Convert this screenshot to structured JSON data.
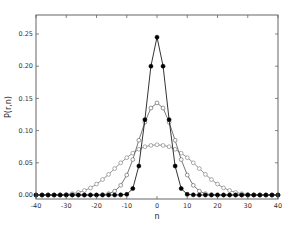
{
  "chart_data": {
    "type": "line",
    "title": "",
    "xlabel": "n",
    "ylabel": "P(r,n)",
    "xlim": [
      -40,
      40
    ],
    "ylim": [
      -0.01,
      0.28
    ],
    "xticks": [
      -40,
      -30,
      -20,
      -10,
      0,
      10,
      20,
      30,
      40
    ],
    "yticks": [
      0.0,
      0.05,
      0.1,
      0.15,
      0.2,
      0.25
    ],
    "xtick_labels": [
      "-40",
      "-30",
      "-20",
      "-10",
      "0",
      "10",
      "20",
      "30",
      "40"
    ],
    "ytick_labels": [
      "0.00",
      "0.05",
      "0.10",
      "0.15",
      "0.20",
      "0.25"
    ],
    "grid": false,
    "legend": null,
    "series": [
      {
        "name": "narrow",
        "marker": "filled-circle",
        "color": "#000000",
        "x": [
          -40,
          -38,
          -36,
          -34,
          -32,
          -30,
          -28,
          -26,
          -24,
          -22,
          -20,
          -18,
          -16,
          -14,
          -12,
          -10,
          -8,
          -6,
          -4,
          -2,
          0,
          2,
          4,
          6,
          8,
          10,
          12,
          14,
          16,
          18,
          20,
          22,
          24,
          26,
          28,
          30,
          32,
          34,
          36,
          38,
          40
        ],
        "y": [
          0,
          0,
          0,
          0,
          0,
          0,
          0,
          0,
          0,
          0,
          0,
          0,
          0,
          0,
          0.0002,
          0.001,
          0.01,
          0.045,
          0.117,
          0.2,
          0.245,
          0.2,
          0.117,
          0.045,
          0.01,
          0.001,
          0.0002,
          0,
          0,
          0,
          0,
          0,
          0,
          0,
          0,
          0,
          0,
          0,
          0,
          0,
          0
        ]
      },
      {
        "name": "medium",
        "marker": "open-circle",
        "color": "#555555",
        "x": [
          -40,
          -38,
          -36,
          -34,
          -32,
          -30,
          -28,
          -26,
          -24,
          -22,
          -20,
          -18,
          -16,
          -14,
          -12,
          -10,
          -8,
          -6,
          -4,
          -2,
          0,
          2,
          4,
          6,
          8,
          10,
          12,
          14,
          16,
          18,
          20,
          22,
          24,
          26,
          28,
          30,
          32,
          34,
          36,
          38,
          40
        ],
        "y": [
          0,
          0,
          0,
          0,
          0,
          0,
          0,
          0,
          0,
          0,
          0,
          0.0005,
          0.002,
          0.006,
          0.015,
          0.031,
          0.055,
          0.085,
          0.113,
          0.135,
          0.143,
          0.135,
          0.113,
          0.085,
          0.055,
          0.031,
          0.015,
          0.006,
          0.002,
          0.0005,
          0,
          0,
          0,
          0,
          0,
          0,
          0,
          0,
          0,
          0,
          0
        ]
      },
      {
        "name": "wide",
        "marker": "open-circle",
        "color": "#777777",
        "x": [
          -40,
          -38,
          -36,
          -34,
          -32,
          -30,
          -28,
          -26,
          -24,
          -22,
          -20,
          -18,
          -16,
          -14,
          -12,
          -10,
          -8,
          -6,
          -4,
          -2,
          0,
          2,
          4,
          6,
          8,
          10,
          12,
          14,
          16,
          18,
          20,
          22,
          24,
          26,
          28,
          30,
          32,
          34,
          36,
          38,
          40
        ],
        "y": [
          0,
          0,
          0,
          0,
          0.0003,
          0.0008,
          0.002,
          0.004,
          0.007,
          0.011,
          0.017,
          0.024,
          0.032,
          0.041,
          0.05,
          0.058,
          0.065,
          0.071,
          0.075,
          0.077,
          0.078,
          0.077,
          0.075,
          0.071,
          0.065,
          0.058,
          0.05,
          0.041,
          0.032,
          0.024,
          0.017,
          0.011,
          0.007,
          0.004,
          0.002,
          0.0008,
          0.0003,
          0,
          0,
          0,
          0
        ]
      }
    ]
  }
}
